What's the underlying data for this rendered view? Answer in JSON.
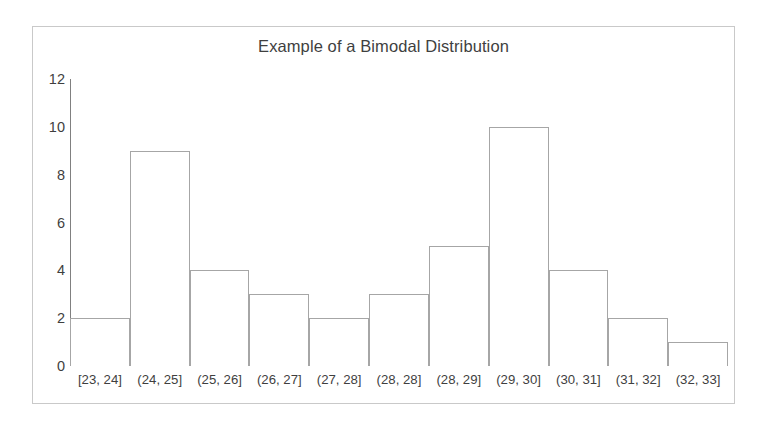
{
  "chart_data": {
    "type": "bar",
    "title": "Example of a Bimodal Distribution",
    "xlabel": "",
    "ylabel": "",
    "grid": false,
    "legend": null,
    "ylim": [
      0,
      12
    ],
    "y_ticks": [
      12,
      10,
      8,
      6,
      4,
      2,
      0
    ],
    "categories": [
      "[23, 24]",
      "(24, 25]",
      "(25, 26]",
      "(26, 27]",
      "(27, 28]",
      "(28, 28]",
      "(28, 29]",
      "(29, 30]",
      "(30, 31]",
      "(31, 32]",
      "(32, 33]"
    ],
    "values": [
      2,
      9,
      4,
      3,
      2,
      3,
      5,
      10,
      4,
      2,
      1
    ],
    "bar_fill_color": "#ffffff",
    "bar_border_color": "#a6a6a6",
    "axis_color": "#808080",
    "text_color": "#3f3f3f",
    "frame_border_color": "#c9c9c9",
    "background_color": "#ffffff"
  }
}
